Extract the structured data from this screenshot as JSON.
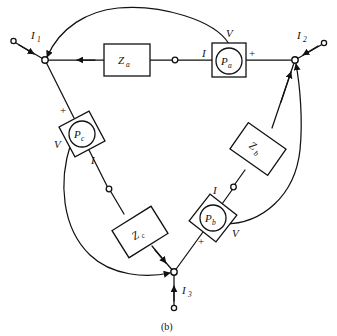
{
  "figure": {
    "caption": "(b)",
    "background_color": "#ffffff",
    "ink_color": "#111111"
  },
  "terminals": [
    {
      "id": "t1",
      "current_label": "I",
      "current_sub": "1"
    },
    {
      "id": "t2",
      "current_label": "I",
      "current_sub": "2"
    },
    {
      "id": "t3",
      "current_label": "I",
      "current_sub": "3"
    }
  ],
  "impedances": [
    {
      "id": "za",
      "label": "Z",
      "sub": "a"
    },
    {
      "id": "zb",
      "label": "Z",
      "sub": "b"
    },
    {
      "id": "zc",
      "label": "Z",
      "sub": "c"
    }
  ],
  "meters": [
    {
      "id": "pa",
      "label": "P",
      "sub": "a",
      "voltage_label": "V",
      "current_label": "I",
      "polarity_label": "+"
    },
    {
      "id": "pb",
      "label": "P",
      "sub": "b",
      "voltage_label": "V",
      "current_label": "I",
      "polarity_label": "+"
    },
    {
      "id": "pc",
      "label": "P",
      "sub": "c",
      "voltage_label": "V",
      "current_label": "I",
      "polarity_label": "+"
    }
  ]
}
